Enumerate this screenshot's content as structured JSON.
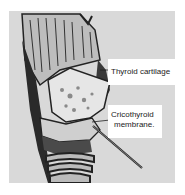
{
  "figure": {
    "background_color": "#d9d9d9",
    "labels": [
      {
        "text": "Thyroid cartilage"
      },
      {
        "line1": "Cricothyroid",
        "line2": "membrane."
      }
    ]
  }
}
